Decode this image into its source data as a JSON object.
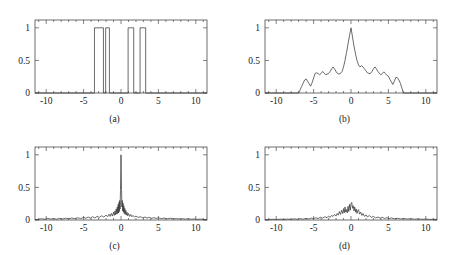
{
  "figure": {
    "background_color": "#ffffff",
    "line_color": "#3a3a3a",
    "axis_color": "#4a4a4a",
    "panel_count": 4
  },
  "chart_data": [
    {
      "id": "a",
      "type": "line",
      "title": "",
      "caption": "(a)",
      "xlabel": "",
      "ylabel": "",
      "xlim": [
        -11.5,
        11.5
      ],
      "ylim": [
        0,
        1.12
      ],
      "xticks": [
        -10,
        -5,
        0,
        5,
        10
      ],
      "xticklabels": [
        "-10",
        "-5",
        "0",
        "5",
        "10"
      ],
      "yticks": [
        0,
        0.5,
        1
      ],
      "yticklabels": [
        "0",
        "0.5",
        "1"
      ],
      "grid": false,
      "legend": null,
      "description": "rectangular pulse train, four unit-amplitude boxes",
      "pulses": [
        {
          "start": -3.55,
          "end": -2.35,
          "height": 1
        },
        {
          "start": -2.05,
          "end": -1.55,
          "height": 1
        },
        {
          "start": 0.95,
          "end": 1.7,
          "height": 1
        },
        {
          "start": 2.55,
          "end": 3.3,
          "height": 1
        }
      ],
      "x": [
        -11.5,
        -3.55,
        -3.55,
        -2.35,
        -2.35,
        -2.05,
        -2.05,
        -1.55,
        -1.55,
        0.95,
        0.95,
        1.7,
        1.7,
        2.55,
        2.55,
        3.3,
        3.3,
        11.5
      ],
      "values": [
        0,
        0,
        1,
        1,
        0,
        0,
        1,
        1,
        0,
        0,
        1,
        1,
        0,
        0,
        1,
        1,
        0,
        0
      ]
    },
    {
      "id": "b",
      "type": "line",
      "title": "",
      "caption": "(b)",
      "xlabel": "",
      "ylabel": "",
      "xlim": [
        -11.5,
        11.5
      ],
      "ylim": [
        0,
        1.12
      ],
      "xticks": [
        -10,
        -5,
        0,
        5,
        10
      ],
      "xticklabels": [
        "-10",
        "-5",
        "0",
        "5",
        "10"
      ],
      "yticks": [
        0,
        0.5,
        1
      ],
      "yticklabels": [
        "0",
        "0.5",
        "1"
      ],
      "grid": false,
      "legend": null,
      "description": "autocorrelation-like oscillating envelope, peak 1.0 at x = 0",
      "x": [
        -11.5,
        -7.0,
        -6.8,
        -6.6,
        -6.4,
        -6.2,
        -6.0,
        -5.8,
        -5.6,
        -5.4,
        -5.2,
        -5.0,
        -4.8,
        -4.6,
        -4.4,
        -4.2,
        -4.0,
        -3.8,
        -3.6,
        -3.4,
        -3.2,
        -3.0,
        -2.8,
        -2.6,
        -2.4,
        -2.2,
        -2.0,
        -1.8,
        -1.6,
        -1.4,
        -1.2,
        -1.0,
        -0.8,
        -0.6,
        -0.4,
        -0.2,
        0.0,
        0.2,
        0.4,
        0.6,
        0.8,
        1.0,
        1.2,
        1.4,
        1.6,
        1.8,
        2.0,
        2.2,
        2.4,
        2.6,
        2.8,
        3.0,
        3.2,
        3.4,
        3.6,
        3.8,
        4.0,
        4.2,
        4.4,
        4.6,
        4.8,
        5.0,
        5.2,
        5.4,
        5.6,
        5.8,
        6.0,
        6.2,
        6.4,
        6.6,
        6.8,
        7.0,
        11.5
      ],
      "values": [
        0,
        0.0,
        0.05,
        0.1,
        0.15,
        0.2,
        0.215,
        0.18,
        0.14,
        0.105,
        0.16,
        0.23,
        0.3,
        0.31,
        0.3,
        0.28,
        0.3,
        0.33,
        0.31,
        0.28,
        0.29,
        0.3,
        0.33,
        0.37,
        0.4,
        0.37,
        0.33,
        0.3,
        0.29,
        0.3,
        0.33,
        0.4,
        0.5,
        0.62,
        0.75,
        0.88,
        1.0,
        0.86,
        0.72,
        0.6,
        0.5,
        0.43,
        0.4,
        0.42,
        0.4,
        0.37,
        0.34,
        0.31,
        0.3,
        0.3,
        0.33,
        0.37,
        0.4,
        0.37,
        0.33,
        0.3,
        0.28,
        0.3,
        0.325,
        0.3,
        0.27,
        0.26,
        0.21,
        0.17,
        0.13,
        0.18,
        0.24,
        0.235,
        0.2,
        0.15,
        0.08,
        0.0,
        0
      ],
      "peaks": [
        {
          "x": 0.0,
          "y": 1.0
        },
        {
          "x": -2.4,
          "y": 0.4
        },
        {
          "x": 1.4,
          "y": 0.42
        },
        {
          "x": 3.2,
          "y": 0.4
        },
        {
          "x": -6.0,
          "y": 0.215
        },
        {
          "x": 6.0,
          "y": 0.24
        }
      ]
    },
    {
      "id": "c",
      "type": "line",
      "title": "",
      "caption": "(c)",
      "xlabel": "",
      "ylabel": "",
      "xlim": [
        -11.5,
        11.5
      ],
      "ylim": [
        0,
        1.12
      ],
      "xticks": [
        -10,
        -5,
        0,
        5,
        10
      ],
      "xticklabels": [
        "-10",
        "-5",
        "0",
        "5",
        "10"
      ],
      "yticks": [
        0,
        0.5,
        1
      ],
      "yticklabels": [
        "0",
        "0.5",
        "1"
      ],
      "grid": false,
      "legend": null,
      "description": "magnitude spectrum, sharp narrow central peak of 1.0 at x = 0 with low noisy sidelobes",
      "peak": {
        "x": 0.0,
        "y": 1.0
      },
      "x": [
        -11.5,
        -11.0,
        -10.6,
        -10.2,
        -9.8,
        -9.4,
        -9.0,
        -8.6,
        -8.2,
        -7.8,
        -7.4,
        -7.0,
        -6.6,
        -6.2,
        -5.8,
        -5.4,
        -5.0,
        -4.7,
        -4.4,
        -4.1,
        -3.8,
        -3.5,
        -3.2,
        -2.9,
        -2.6,
        -2.3,
        -2.0,
        -1.8,
        -1.6,
        -1.45,
        -1.3,
        -1.15,
        -1.0,
        -0.9,
        -0.8,
        -0.72,
        -0.64,
        -0.56,
        -0.5,
        -0.44,
        -0.38,
        -0.32,
        -0.27,
        -0.22,
        -0.17,
        -0.12,
        -0.07,
        -0.03,
        0.0,
        0.03,
        0.07,
        0.12,
        0.17,
        0.22,
        0.27,
        0.32,
        0.38,
        0.44,
        0.5,
        0.56,
        0.64,
        0.72,
        0.8,
        0.9,
        1.0,
        1.15,
        1.3,
        1.45,
        1.6,
        1.8,
        2.0,
        2.3,
        2.6,
        2.9,
        3.2,
        3.5,
        3.8,
        4.1,
        4.4,
        4.7,
        5.0,
        5.4,
        5.8,
        6.2,
        6.6,
        7.0,
        7.4,
        7.8,
        8.2,
        8.6,
        9.0,
        9.4,
        9.8,
        10.2,
        10.6,
        11.0,
        11.5
      ],
      "values": [
        0.005,
        0.01,
        0.02,
        0.012,
        0.025,
        0.014,
        0.022,
        0.012,
        0.026,
        0.015,
        0.028,
        0.018,
        0.03,
        0.02,
        0.034,
        0.022,
        0.04,
        0.025,
        0.045,
        0.03,
        0.05,
        0.032,
        0.055,
        0.04,
        0.065,
        0.045,
        0.075,
        0.05,
        0.09,
        0.055,
        0.1,
        0.06,
        0.12,
        0.07,
        0.14,
        0.08,
        0.17,
        0.09,
        0.2,
        0.1,
        0.24,
        0.11,
        0.27,
        0.13,
        0.3,
        0.17,
        0.45,
        0.75,
        1.0,
        0.78,
        0.47,
        0.2,
        0.3,
        0.14,
        0.26,
        0.12,
        0.22,
        0.1,
        0.18,
        0.085,
        0.15,
        0.075,
        0.12,
        0.065,
        0.1,
        0.055,
        0.085,
        0.05,
        0.07,
        0.045,
        0.06,
        0.04,
        0.05,
        0.034,
        0.045,
        0.03,
        0.04,
        0.026,
        0.036,
        0.024,
        0.032,
        0.022,
        0.028,
        0.02,
        0.026,
        0.018,
        0.022,
        0.016,
        0.02,
        0.014,
        0.018,
        0.012,
        0.016,
        0.01,
        0.014,
        0.009,
        0.006
      ]
    },
    {
      "id": "d",
      "type": "line",
      "title": "",
      "caption": "(d)",
      "xlabel": "",
      "ylabel": "",
      "xlim": [
        -11.5,
        11.5
      ],
      "ylim": [
        0,
        1.12
      ],
      "xticks": [
        -10,
        -5,
        0,
        5,
        10
      ],
      "xticklabels": [
        "-10",
        "-5",
        "0",
        "5",
        "10"
      ],
      "yticks": [
        0,
        0.5,
        1
      ],
      "yticklabels": [
        "0",
        "0.5",
        "1"
      ],
      "grid": false,
      "legend": null,
      "description": "noisy magnitude spectrum, broad low-amplitude cluster peaking near 0.27 around x = 0",
      "peak": {
        "x": 0.1,
        "y": 0.27
      },
      "x": [
        -11.5,
        -11.0,
        -10.5,
        -10.0,
        -9.5,
        -9.0,
        -8.5,
        -8.0,
        -7.6,
        -7.2,
        -6.8,
        -6.4,
        -6.0,
        -5.6,
        -5.3,
        -5.0,
        -4.7,
        -4.4,
        -4.1,
        -3.8,
        -3.5,
        -3.2,
        -3.0,
        -2.8,
        -2.6,
        -2.4,
        -2.2,
        -2.0,
        -1.85,
        -1.7,
        -1.55,
        -1.4,
        -1.25,
        -1.1,
        -1.0,
        -0.9,
        -0.8,
        -0.7,
        -0.6,
        -0.5,
        -0.4,
        -0.3,
        -0.2,
        -0.1,
        0.0,
        0.1,
        0.2,
        0.3,
        0.4,
        0.5,
        0.6,
        0.7,
        0.8,
        0.9,
        1.0,
        1.15,
        1.3,
        1.45,
        1.6,
        1.8,
        2.0,
        2.2,
        2.45,
        2.7,
        3.0,
        3.3,
        3.6,
        3.9,
        4.2,
        4.5,
        4.8,
        5.1,
        5.4,
        5.8,
        6.2,
        6.6,
        7.0,
        7.5,
        8.0,
        8.5,
        9.0,
        9.5,
        10.0,
        10.5,
        11.0,
        11.5
      ],
      "values": [
        0.004,
        0.008,
        0.012,
        0.007,
        0.013,
        0.008,
        0.015,
        0.01,
        0.018,
        0.011,
        0.02,
        0.013,
        0.024,
        0.016,
        0.03,
        0.02,
        0.035,
        0.022,
        0.042,
        0.028,
        0.05,
        0.035,
        0.06,
        0.04,
        0.07,
        0.055,
        0.085,
        0.06,
        0.1,
        0.075,
        0.13,
        0.085,
        0.15,
        0.1,
        0.175,
        0.11,
        0.2,
        0.12,
        0.16,
        0.11,
        0.21,
        0.13,
        0.24,
        0.15,
        0.25,
        0.27,
        0.18,
        0.22,
        0.14,
        0.2,
        0.12,
        0.17,
        0.1,
        0.14,
        0.16,
        0.09,
        0.12,
        0.07,
        0.1,
        0.055,
        0.08,
        0.045,
        0.07,
        0.04,
        0.055,
        0.032,
        0.045,
        0.028,
        0.04,
        0.024,
        0.035,
        0.022,
        0.03,
        0.02,
        0.026,
        0.017,
        0.022,
        0.015,
        0.019,
        0.013,
        0.016,
        0.011,
        0.014,
        0.009,
        0.012,
        0.007
      ]
    }
  ]
}
